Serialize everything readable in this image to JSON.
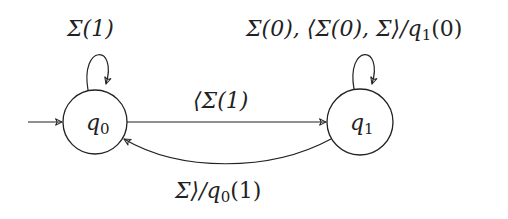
{
  "diagram": {
    "type": "state-machine",
    "states": [
      {
        "id": "q0",
        "label_main": "q",
        "label_sub": "0",
        "initial": true
      },
      {
        "id": "q1",
        "label_main": "q",
        "label_sub": "1",
        "initial": false
      }
    ],
    "transitions": [
      {
        "from": "q0",
        "to": "q0",
        "label": "Σ(1)"
      },
      {
        "from": "q1",
        "to": "q1",
        "label": "Σ(0), ⟨Σ(0), Σ⟩/q₁(0)"
      },
      {
        "from": "q0",
        "to": "q1",
        "label": "⟨Σ(1)"
      },
      {
        "from": "q1",
        "to": "q0",
        "label": "Σ⟩/q₀(1)"
      }
    ]
  },
  "labels": {
    "q0_self_loop": "Σ(1)",
    "q1_self_loop_a": "Σ(0), ⟨Σ(0), Σ⟩/q",
    "q1_self_loop_sub": "1",
    "q1_self_loop_b": "(0)",
    "q0_to_q1": "⟨Σ(1)",
    "q1_to_q0_a": "Σ⟩/q",
    "q1_to_q0_sub": "0",
    "q1_to_q0_b": "(1)",
    "q0_main": "q",
    "q0_sub": "0",
    "q1_main": "q",
    "q1_sub": "1"
  },
  "colors": {
    "stroke": "#222222",
    "background": "#ffffff"
  }
}
